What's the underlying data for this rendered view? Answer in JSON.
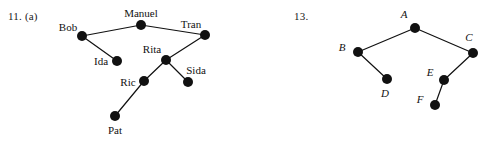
{
  "page": {
    "width": 487,
    "height": 141,
    "background": "#ffffff",
    "ink_color": "#111111"
  },
  "figures": [
    {
      "id": "figure-11a",
      "number_label": "11. (a)",
      "style": "upright",
      "node_radius": 5,
      "nodes": [
        {
          "id": "manuel",
          "label": "Manuel",
          "x": 141,
          "y": 25,
          "label_x": 141,
          "label_y": 13
        },
        {
          "id": "bob",
          "label": "Bob",
          "x": 82,
          "y": 36,
          "label_x": 68,
          "label_y": 27
        },
        {
          "id": "tran",
          "label": "Tran",
          "x": 205,
          "y": 35,
          "label_x": 191,
          "label_y": 24
        },
        {
          "id": "ida",
          "label": "Ida",
          "x": 117,
          "y": 61,
          "label_x": 101,
          "label_y": 61
        },
        {
          "id": "rita",
          "label": "Rita",
          "x": 166,
          "y": 60,
          "label_x": 152,
          "label_y": 49
        },
        {
          "id": "sida",
          "label": "Sida",
          "x": 188,
          "y": 82,
          "label_x": 196,
          "label_y": 70
        },
        {
          "id": "ric",
          "label": "Ric",
          "x": 144,
          "y": 81,
          "label_x": 128,
          "label_y": 82
        },
        {
          "id": "pat",
          "label": "Pat",
          "x": 115,
          "y": 116,
          "label_x": 115,
          "label_y": 130
        }
      ],
      "edges": [
        {
          "from": "bob",
          "to": "manuel"
        },
        {
          "from": "manuel",
          "to": "tran"
        },
        {
          "from": "bob",
          "to": "ida"
        },
        {
          "from": "tran",
          "to": "rita"
        },
        {
          "from": "rita",
          "to": "sida"
        },
        {
          "from": "rita",
          "to": "ric"
        },
        {
          "from": "ric",
          "to": "pat"
        }
      ]
    },
    {
      "id": "figure-13",
      "number_label": "13.",
      "style": "italic",
      "node_radius": 5,
      "nodes": [
        {
          "id": "A",
          "label": "A",
          "x": 171,
          "y": 28,
          "label_x": 160,
          "label_y": 14
        },
        {
          "id": "B",
          "label": "B",
          "x": 114,
          "y": 52,
          "label_x": 98,
          "label_y": 47
        },
        {
          "id": "C",
          "label": "C",
          "x": 229,
          "y": 53,
          "label_x": 225,
          "label_y": 37
        },
        {
          "id": "D",
          "label": "D",
          "x": 143,
          "y": 79,
          "label_x": 141,
          "label_y": 93
        },
        {
          "id": "E",
          "label": "E",
          "x": 200,
          "y": 80,
          "label_x": 186,
          "label_y": 72
        },
        {
          "id": "F",
          "label": "F",
          "x": 191,
          "y": 105,
          "label_x": 176,
          "label_y": 99
        }
      ],
      "edges": [
        {
          "from": "A",
          "to": "B"
        },
        {
          "from": "A",
          "to": "C"
        },
        {
          "from": "B",
          "to": "D"
        },
        {
          "from": "C",
          "to": "E"
        },
        {
          "from": "E",
          "to": "F"
        }
      ]
    }
  ]
}
